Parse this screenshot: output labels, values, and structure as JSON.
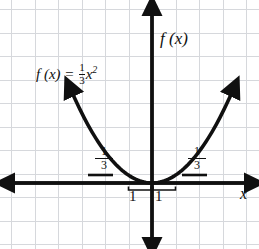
{
  "figure": {
    "type": "graph-paper-parabola",
    "background": "#ffffff",
    "grid_color": "#c9ccd1",
    "ink_color": "#101010"
  },
  "labels": {
    "equation_lhs": "f (x) =",
    "equation_coeff_num": "1",
    "equation_coeff_den": "3",
    "equation_var": "x",
    "equation_exp": "2",
    "y_axis": "f (x)",
    "x_axis": "x",
    "run_left": "1",
    "run_right": "1",
    "rise_left_num": "1",
    "rise_left_den": "3",
    "rise_right_num": "1",
    "rise_right_den": "3"
  },
  "chart_data": {
    "type": "line",
    "xlabel": "x",
    "ylabel": "f (x)",
    "grid": true,
    "legend": "none",
    "function": "f(x) = (1/3)x^2",
    "coefficient": 0.3333333,
    "vertex": [
      0,
      0
    ],
    "xlim": [
      -6.3,
      4.5
    ],
    "ylim": [
      -2.7,
      7.7
    ],
    "origin_px": [
      152,
      183
    ],
    "unit_px": 23.5,
    "axes": {
      "x_axis_arrows": [
        "left",
        "right"
      ],
      "y_axis_arrows": [
        "up",
        "down"
      ],
      "x_axis_y_px": 183,
      "y_axis_x_px": 152
    },
    "curve_arrows": [
      "upper-left",
      "upper-right"
    ],
    "x": [
      -3.4,
      -3.0,
      -2.5,
      -2.0,
      -1.5,
      -1.0,
      -0.5,
      0.0,
      0.5,
      1.0,
      1.5,
      2.0,
      2.5,
      3.0,
      3.4
    ],
    "values": [
      3.85,
      3.0,
      2.08,
      1.33,
      0.75,
      0.33,
      0.08,
      0.0,
      0.08,
      0.33,
      0.75,
      1.33,
      2.08,
      3.0,
      3.85
    ],
    "annotations": [
      {
        "name": "equation-label",
        "text": "f (x) = 1/3 x²",
        "x_px": 36,
        "y_px": 62
      },
      {
        "name": "run-marker-left",
        "text": "1",
        "unit_span": [
          -1,
          0
        ]
      },
      {
        "name": "run-marker-right",
        "text": "1",
        "unit_span": [
          0,
          1
        ]
      },
      {
        "name": "rise-marker-left",
        "text": "1/3",
        "at_x": -2
      },
      {
        "name": "rise-marker-right",
        "text": "1/3",
        "at_x": 2
      }
    ]
  }
}
